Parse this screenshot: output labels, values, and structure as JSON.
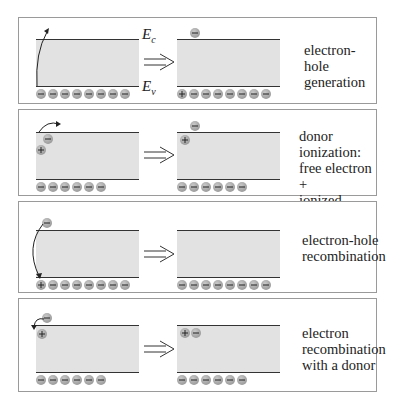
{
  "panels": [
    {
      "id": "electron-hole-generation",
      "description": [
        "electron-hole",
        "generation"
      ],
      "band_labels": {
        "conduction": "E",
        "conduction_sub": "c",
        "valence": "E",
        "valence_sub": "v"
      },
      "before": {
        "valence_charges": [
          "-",
          "-",
          "-",
          "-",
          "-",
          "-",
          "-"
        ],
        "conduction_charges": [],
        "transition": "valence-to-conduction arrow"
      },
      "after": {
        "valence_charges": [
          "+",
          "-",
          "-",
          "-",
          "-",
          "-",
          "-"
        ],
        "conduction_charges": [
          "-"
        ]
      }
    },
    {
      "id": "donor-ionization",
      "description": [
        "donor ionization:",
        "free electron +",
        "ionized donor"
      ],
      "before": {
        "valence_charges": [
          "-",
          "-",
          "-",
          "-",
          "-",
          "-"
        ],
        "donor": [
          "+",
          "-"
        ],
        "transition": "donor electron to conduction arrow"
      },
      "after": {
        "valence_charges": [
          "-",
          "-",
          "-",
          "-",
          "-",
          "-"
        ],
        "conduction_charges": [
          "-"
        ],
        "donor": [
          "+"
        ]
      }
    },
    {
      "id": "electron-hole-recombination",
      "description": [
        "electron-hole",
        "recombination"
      ],
      "before": {
        "valence_charges": [
          "+",
          "-",
          "-",
          "-",
          "-",
          "-",
          "-"
        ],
        "conduction_charges": [
          "-"
        ],
        "transition": "conduction-to-valence arrow"
      },
      "after": {
        "valence_charges": [
          "-",
          "-",
          "-",
          "-",
          "-",
          "-",
          "-"
        ],
        "conduction_charges": []
      }
    },
    {
      "id": "electron-recombination-donor",
      "description": [
        "electron",
        "recombination",
        "with a donor"
      ],
      "before": {
        "valence_charges": [
          "-",
          "-",
          "-",
          "-",
          "-",
          "-"
        ],
        "conduction_charges": [
          "-"
        ],
        "donor": [
          "+"
        ],
        "transition": "electron to donor arrow"
      },
      "after": {
        "valence_charges": [
          "-",
          "-",
          "-",
          "-",
          "-",
          "-"
        ],
        "donor": [
          "+",
          "-"
        ]
      }
    }
  ],
  "arrow_symbol": "⇒",
  "colors": {
    "band_fill": "#e2e2e2",
    "band_edge": "#333333",
    "charge_fill": "#a0a0a0",
    "border": "#9a9a9a"
  }
}
